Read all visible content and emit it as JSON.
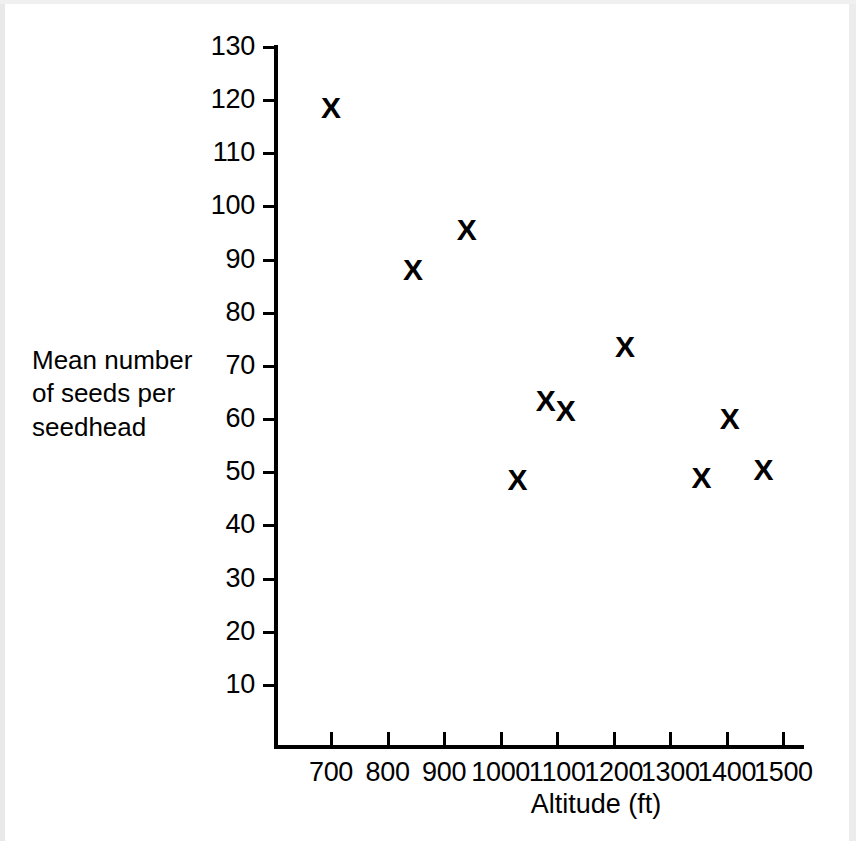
{
  "chart_data": {
    "type": "scatter",
    "title": "",
    "xlabel": "Altitude (ft)",
    "ylabel": "Mean number of seeds per seedhead",
    "ylabel_lines": [
      "Mean number",
      "of seeds per",
      "seedhead"
    ],
    "marker": "X",
    "grid": false,
    "legend": null,
    "xlim": [
      650,
      1530
    ],
    "ylim": [
      0,
      133
    ],
    "xticks": [
      700,
      800,
      900,
      1000,
      1100,
      1200,
      1300,
      1400,
      1500
    ],
    "yticks": [
      10,
      20,
      30,
      40,
      50,
      60,
      70,
      80,
      90,
      100,
      110,
      120,
      130
    ],
    "xticklabels": [
      "700",
      "800",
      "900",
      "1000",
      "1100",
      "1200",
      "1300",
      "1400",
      "1500"
    ],
    "yticklabels": [
      "10",
      "20",
      "30",
      "40",
      "50",
      "60",
      "70",
      "80",
      "90",
      "100",
      "110",
      "120",
      "130"
    ],
    "points": [
      {
        "x": 700,
        "y": 118.5
      },
      {
        "x": 845,
        "y": 88
      },
      {
        "x": 940,
        "y": 95.5
      },
      {
        "x": 1030,
        "y": 48.5
      },
      {
        "x": 1080,
        "y": 63.5
      },
      {
        "x": 1115,
        "y": 61.5
      },
      {
        "x": 1220,
        "y": 73.5
      },
      {
        "x": 1355,
        "y": 49
      },
      {
        "x": 1405,
        "y": 60
      },
      {
        "x": 1465,
        "y": 50.5
      }
    ]
  },
  "colors": {
    "ink": "#000000",
    "paper": "#ffffff",
    "page_edge": "#e9e9e9"
  }
}
